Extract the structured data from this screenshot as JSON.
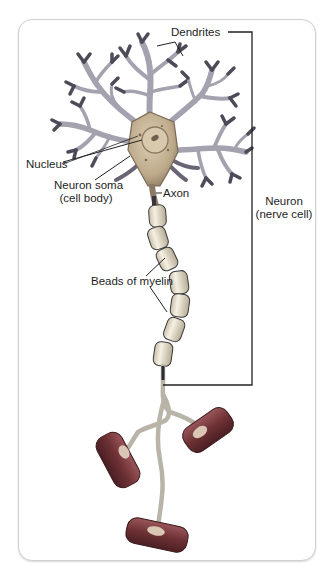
{
  "diagram": {
    "title": "Neuron (nerve cell)",
    "labels": {
      "dendrites": "Dendrites",
      "nucleus": "Nucleus",
      "soma_line1": "Neuron soma",
      "soma_line2": "(cell body)",
      "axon": "Axon",
      "neuron_line1": "Neuron",
      "neuron_line2": "(nerve cell)",
      "myelin": "Beads of myelin"
    },
    "parts": [
      "dendrites",
      "nucleus",
      "neuron soma (cell body)",
      "axon",
      "beads of myelin",
      "axon terminals"
    ],
    "colors": {
      "soma": "#c9b89a",
      "dendrite": "#9a98a6",
      "dendrite_tip": "#4e4a58",
      "myelin": "#ece4cf",
      "terminal": "#7a3b3f",
      "line": "#2a2a2a"
    }
  }
}
